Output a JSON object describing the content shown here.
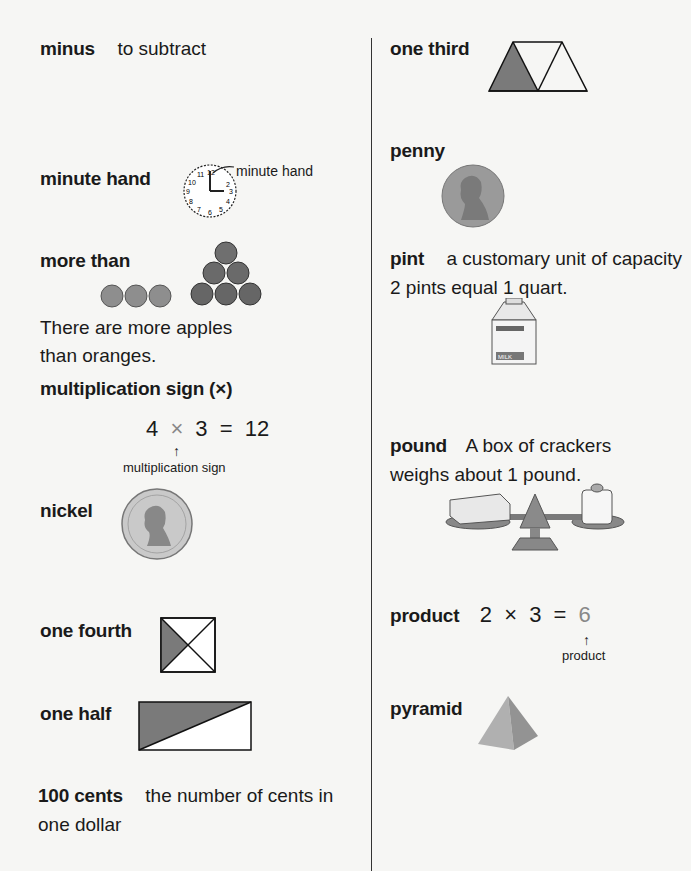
{
  "left_column": {
    "minus": {
      "term": "minus",
      "definition": "to subtract"
    },
    "minute_hand": {
      "term": "minute hand",
      "label": "minute hand",
      "clock_numbers": [
        "12",
        "1",
        "2",
        "3",
        "4",
        "5",
        "6",
        "7",
        "8",
        "9",
        "10",
        "11"
      ]
    },
    "more_than": {
      "term": "more than",
      "sentence_line1": "There are more apples",
      "sentence_line2": "than oranges.",
      "oranges_count": 3,
      "apples_count": 6
    },
    "multiplication_sign": {
      "term": "multiplication sign (×)",
      "equation": {
        "a": "4",
        "op": "×",
        "b": "3",
        "eq": "=",
        "result": "12"
      },
      "arrow": "↑",
      "label": "multiplication sign"
    },
    "nickel": {
      "term": "nickel"
    },
    "one_fourth": {
      "term": "one fourth"
    },
    "one_half": {
      "term": "one half"
    },
    "hundred_cents": {
      "term": "100 cents",
      "definition_line1": "the number of cents in",
      "definition_line2": "one dollar"
    }
  },
  "right_column": {
    "one_third": {
      "term": "one third"
    },
    "penny": {
      "term": "penny"
    },
    "pint": {
      "term": "pint",
      "definition": "a customary unit of capacity",
      "line2": "2 pints equal 1 quart.",
      "carton_label": "MILK"
    },
    "pound": {
      "term": "pound",
      "definition": "A box of crackers",
      "line2": "weighs about 1 pound."
    },
    "product": {
      "term": "product",
      "equation": {
        "a": "2",
        "op": "×",
        "b": "3",
        "eq": "=",
        "result": "6"
      },
      "arrow": "↑",
      "label": "product"
    },
    "pyramid": {
      "term": "pyramid"
    }
  },
  "colors": {
    "shade": "#7a7a7a",
    "background": "#f6f6f4",
    "text": "#1a1a1a"
  }
}
